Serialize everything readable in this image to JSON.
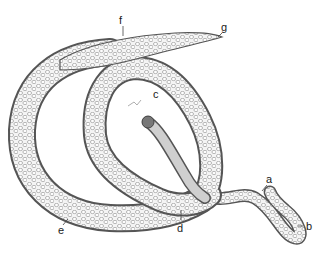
{
  "figure": {
    "labels": [
      {
        "id": "a",
        "text": "a"
      },
      {
        "id": "b",
        "text": "b"
      },
      {
        "id": "c",
        "text": "c"
      },
      {
        "id": "d",
        "text": "d"
      },
      {
        "id": "e",
        "text": "e"
      },
      {
        "id": "f",
        "text": "f"
      },
      {
        "id": "g",
        "text": "g"
      }
    ],
    "colors": {
      "outline": "#555555",
      "cells": "#9a9a9a",
      "background": "#ffffff"
    }
  }
}
